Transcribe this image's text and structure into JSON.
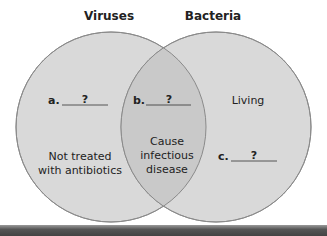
{
  "left_set": {
    "label": "Viruses",
    "item_label": "a.",
    "item_blank": "?",
    "text_lines": [
      "Not treated",
      "with antibiotics"
    ]
  },
  "right_set": {
    "label": "Bacteria",
    "text": "Living",
    "item_label": "c.",
    "item_blank": "?"
  },
  "overlap": {
    "item_label": "b.",
    "item_blank": "?",
    "text_lines": [
      "Cause",
      "infectious",
      "disease"
    ]
  },
  "colors": {
    "circle_fill": "#d8d8d8",
    "overlap_fill": "#c8c8c8",
    "stroke": "#8a8a8a"
  }
}
